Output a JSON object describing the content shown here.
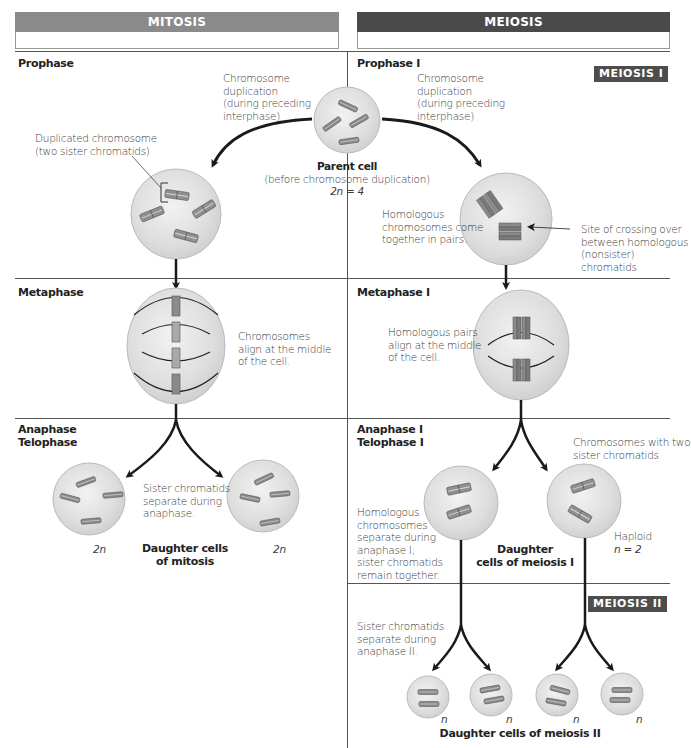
{
  "headers": {
    "mitosis": "MITOSIS",
    "meiosis": "MEIOSIS",
    "meiosis_1_tag": "MEIOSIS I",
    "meiosis_2_tag": "MEIOSIS II"
  },
  "colors": {
    "mitosis_header": "#8a8a8a",
    "meiosis_header": "#4a4a4a",
    "cell_fill": "#dcdcdc",
    "cell_edge": "#bdbdbd",
    "chromosome": "#7a7a7a",
    "arrow": "#1a1a1a"
  },
  "parent_cell": {
    "title": "Parent cell",
    "subtitle": "(before chromosome duplication)",
    "ploidy": "2n = 4"
  },
  "mitosis": {
    "prophase": {
      "stage": "Prophase",
      "duplication_note": [
        "Chromosome",
        "duplication",
        "(during preceding",
        "interphase)"
      ],
      "duplicated_label": [
        "Duplicated chromosome",
        "(two sister chromatids)"
      ]
    },
    "metaphase": {
      "stage": "Metaphase",
      "note": [
        "Chromosomes",
        "align at the middle",
        "of the cell."
      ]
    },
    "anaphase_telophase": {
      "stage": [
        "Anaphase",
        "Telophase"
      ],
      "note": [
        "Sister chromatids",
        "separate during",
        "anaphase."
      ],
      "left_ploidy": "2n",
      "right_ploidy": "2n",
      "daughter_label": [
        "Daughter cells",
        "of mitosis"
      ]
    }
  },
  "meiosis": {
    "prophase": {
      "stage": "Prophase I",
      "duplication_note": [
        "Chromosome",
        "duplication",
        "(during preceding",
        "interphase)"
      ],
      "homologous_note": [
        "Homologous",
        "chromosomes come",
        "together in pairs."
      ],
      "crossing_note": [
        "Site of crossing over",
        "between homologous",
        "(nonsister) chromatids"
      ]
    },
    "metaphase": {
      "stage": "Metaphase I",
      "note": [
        "Homologous pairs",
        "align at the middle",
        "of the cell."
      ]
    },
    "anaphase_telophase": {
      "stage": [
        "Anaphase I",
        "Telophase I"
      ],
      "chromosomes_note": [
        "Chromosomes with two",
        "sister chromatids"
      ],
      "separate_note": [
        "Homologous",
        "chromosomes",
        "separate during",
        "anaphase I;",
        "sister chromatids",
        "remain together."
      ],
      "haploid_note": [
        "Haploid",
        "n = 2"
      ],
      "daughter_label": [
        "Daughter",
        "cells of meiosis I"
      ]
    },
    "meiosis_2": {
      "note": [
        "Sister chromatids",
        "separate during",
        "anaphase II."
      ],
      "ploidy_labels": [
        "n",
        "n",
        "n",
        "n"
      ],
      "daughter_label": "Daughter cells of meiosis II"
    }
  }
}
